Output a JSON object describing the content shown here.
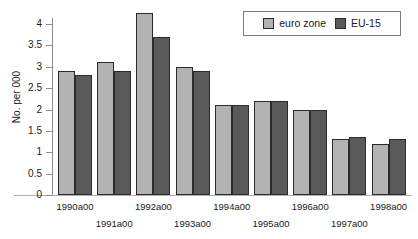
{
  "chart_data": {
    "type": "bar",
    "title": "",
    "xlabel": "",
    "ylabel": "No. per 000",
    "ylim": [
      0,
      4.5
    ],
    "grid": false,
    "legend_position": "top-right",
    "categories": [
      "1990a00",
      "1991a00",
      "1992a00",
      "1993a00",
      "1994a00",
      "1995a00",
      "1996a00",
      "1997a00",
      "1998a00"
    ],
    "yticks": [
      "0",
      "0.5",
      "1",
      "1.5",
      "2",
      "2.5",
      "3",
      "3.5",
      "4"
    ],
    "ytick_values": [
      0,
      0.5,
      1,
      1.5,
      2,
      2.5,
      3,
      3.5,
      4
    ],
    "series": [
      {
        "name": "euro zone",
        "color": "#b3b3b3",
        "values": [
          2.9,
          3.1,
          4.25,
          3.0,
          2.1,
          2.2,
          2.0,
          1.3,
          1.2
        ]
      },
      {
        "name": "EU-15",
        "color": "#5a5a5a",
        "values": [
          2.8,
          2.9,
          3.7,
          2.9,
          2.1,
          2.2,
          2.0,
          1.35,
          1.3
        ]
      }
    ]
  },
  "legend": {
    "entries": [
      {
        "label": "euro zone",
        "swatch": "light"
      },
      {
        "label": "EU-15",
        "swatch": "dark"
      }
    ]
  }
}
